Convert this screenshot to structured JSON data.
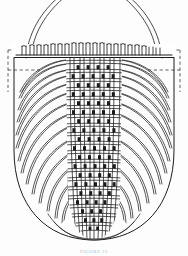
{
  "figure": {
    "medium": "black-and-white line drawing",
    "background_color": "#fdfdfd",
    "ink_color": "#1d1d1d",
    "caption_text": "FIGURE 12",
    "caption_color": "#b9b9b9",
    "caption_note": "caption partially cropped at bottom edge of image",
    "parts": [
      {
        "name": "handle",
        "label": "bail handle",
        "description": "two thin parallel arcing lines rising from each rim end and meeting above the basket, cropped by the top edge of the image"
      },
      {
        "name": "rim",
        "label": "rim band",
        "description": "horizontal band across the upper basket with a row of short vertical stake ends / loops"
      },
      {
        "name": "reconstruction-outline-left",
        "label": "dashed reconstruction outline (left)",
        "description": "dashed rectangle at the left rim corner indicating a missing or restored area"
      },
      {
        "name": "reconstruction-outline-right",
        "label": "dashed reconstruction outline (right)",
        "description": "dashed rectangle at the right rim corner indicating a missing or restored area"
      },
      {
        "name": "weave-panel",
        "label": "central plaited twill panel",
        "description": "vertical column of interlaced warp and weft elements forming a basket-weave / twill texture down the centre of the vessel"
      },
      {
        "name": "flank-strands-left",
        "label": "radiating strands (left flank)",
        "description": "family of long curved strands sweeping from the rim down and inward toward the base"
      },
      {
        "name": "flank-strands-right",
        "label": "radiating strands (right flank)",
        "description": "family of long curved strands sweeping from the rim down and inward toward the base"
      },
      {
        "name": "body-outline",
        "label": "body silhouette",
        "description": "rounded U-shaped outer contour of the basket body"
      },
      {
        "name": "base",
        "label": "base",
        "description": "rounded bottom where the curved strands converge beneath the weave panel"
      }
    ],
    "measurements": {
      "image_width": 188,
      "image_height": 256,
      "rim_y": 58,
      "base_y": 238,
      "body_left_x": 14,
      "body_right_x": 174,
      "weave_panel_left_x": 68,
      "weave_panel_right_x": 120,
      "rim_stake_count": 22,
      "weave_warp_count": 7,
      "weave_weft_rows": 18,
      "flank_strand_count": 9
    }
  }
}
